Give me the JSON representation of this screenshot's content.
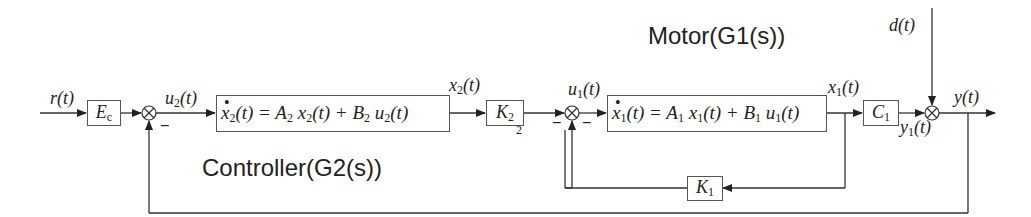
{
  "diagram": {
    "type": "block-diagram",
    "titles": {
      "motor": "Motor(G1(s))",
      "controller": "Controller(G2(s))"
    },
    "signals": {
      "input": "r(t)",
      "u2": "u",
      "u2_sub": "2",
      "x2": "x",
      "x2_sub": "2",
      "u1": "u",
      "u1_sub": "1",
      "x1": "x",
      "x1_sub": "1",
      "disturbance": "d(t)",
      "output": "y(t)",
      "y1": "y",
      "y1_sub": "1",
      "t_suffix": "(t)"
    },
    "blocks": {
      "ec": {
        "main": "E",
        "sub": "c"
      },
      "controller_eq": {
        "lhs": "x",
        "lhs_sub": "2",
        "lhs_t": "(t) = ",
        "a": "A",
        "a_sub": "2",
        "ax": " x",
        "ax_sub": "2",
        "ax_t": "(t) + ",
        "b": "B",
        "b_sub": "2",
        "bu": " u",
        "bu_sub": "2",
        "bu_t": "(t)"
      },
      "k2": {
        "main": "K",
        "sub": "2",
        "stray": "2"
      },
      "motor_eq": {
        "lhs": "x",
        "lhs_sub": "1",
        "lhs_t": "(t) = ",
        "a": "A",
        "a_sub": "1",
        "ax": " x",
        "ax_sub": "1",
        "ax_t": "(t) + ",
        "b": "B",
        "b_sub": "1",
        "bu": " u",
        "bu_sub": "1",
        "bu_t": "(t)"
      },
      "k1": {
        "main": "K",
        "sub": "1"
      },
      "c1": {
        "main": "C",
        "sub": "1"
      }
    },
    "summing_junctions": [
      {
        "id": "sum1",
        "symbol": "⊗",
        "sign": "−"
      },
      {
        "id": "sum2",
        "symbol": "⊗",
        "sign_left": "−",
        "sign_right": "−"
      },
      {
        "id": "sum3",
        "symbol": "⊗"
      }
    ],
    "dot": "•",
    "minus": "−"
  }
}
